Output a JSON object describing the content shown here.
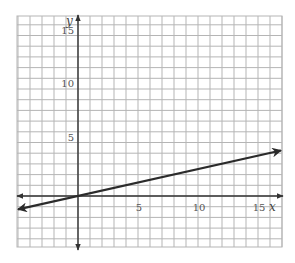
{
  "chart_data": {
    "type": "line",
    "title": "",
    "xlabel": "x",
    "ylabel": "y",
    "xlim": [
      -5,
      17
    ],
    "ylim": [
      -5,
      17
    ],
    "x_ticks": [
      5,
      10,
      15
    ],
    "y_ticks": [
      5,
      10,
      15
    ],
    "x_tick_labels": [
      "5",
      "10",
      "15"
    ],
    "y_tick_labels": [
      "5",
      "10",
      "15"
    ],
    "grid": true,
    "grid_step": 1,
    "legend": null,
    "series": [
      {
        "name": "line",
        "equation": "y = x/4",
        "slope": 0.25,
        "intercept": 0,
        "x": [
          -5,
          0,
          17
        ],
        "values": [
          -1.25,
          0,
          4.25
        ],
        "arrows": "both"
      }
    ]
  },
  "colors": {
    "grid": "#b5b5b5",
    "axis": "#333333",
    "line": "#2b2b2b",
    "labels": "#555555"
  },
  "layout": {
    "px_left": 17,
    "px_right": 282,
    "px_top": 16,
    "px_bottom": 247,
    "origin_px": [
      78,
      196
    ],
    "sx": 12,
    "sy": 10.7
  }
}
